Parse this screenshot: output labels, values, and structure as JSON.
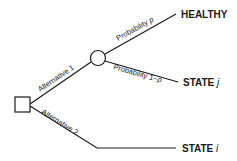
{
  "diagram": {
    "type": "decision-tree",
    "nodes": {
      "decision": {
        "shape": "square",
        "label": ""
      },
      "chance": {
        "shape": "circle",
        "label": ""
      }
    },
    "branches": {
      "alternative1": "Alternative 1",
      "alternative2": "Alternative 2",
      "prob_p": "Probability ",
      "prob_p_var": "p",
      "prob_1mp": "Probability 1−",
      "prob_1mp_var": "p"
    },
    "outcomes": {
      "healthy": "HEALTHY",
      "state_j": "STATE ",
      "state_j_var": "j",
      "state_i": "STATE ",
      "state_i_var": "i"
    },
    "colors": {
      "line": "#1a1a1a",
      "background": "#ffffff"
    }
  }
}
